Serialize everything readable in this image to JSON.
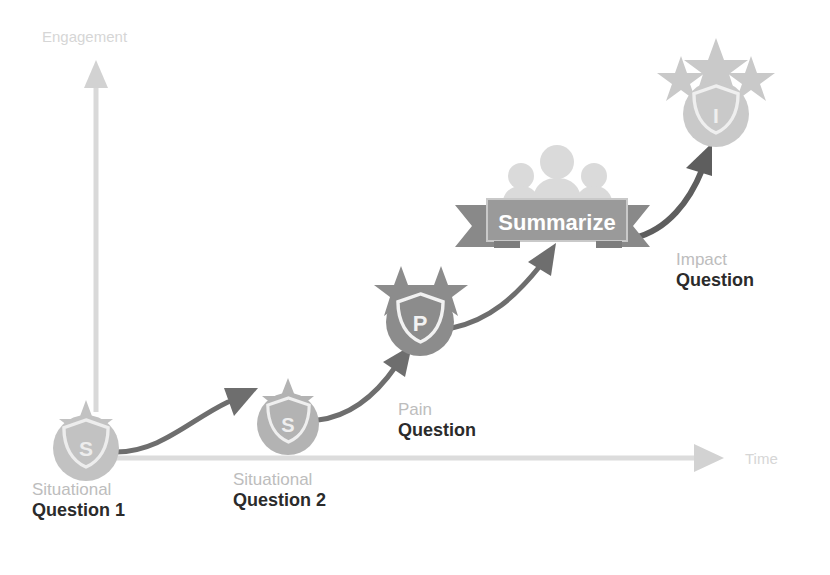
{
  "diagram": {
    "axes": {
      "y": {
        "label": "Engagement",
        "color": "#d6d6d6"
      },
      "x": {
        "label": "Time",
        "color": "#d6d6d6"
      }
    },
    "nodes": [
      {
        "id": "situational-1",
        "badge_letter": "S",
        "stars": 1,
        "category": "Situational",
        "question": "Question 1",
        "circle_color": "#c2c2c2",
        "cx": 86,
        "cy": 448,
        "r": 33
      },
      {
        "id": "situational-2",
        "badge_letter": "S",
        "stars": 1,
        "category": "Situational",
        "question": "Question 2",
        "circle_color": "#b3b3b3",
        "cx": 288,
        "cy": 424,
        "r": 31
      },
      {
        "id": "pain",
        "badge_letter": "P",
        "stars": 2,
        "category": "Pain",
        "question": "Question",
        "circle_color": "#8c8c8c",
        "cx": 420,
        "cy": 322,
        "r": 34
      },
      {
        "id": "impact",
        "badge_letter": "I",
        "stars": 3,
        "category": "Impact",
        "question": "Question",
        "circle_color": "#c9c9c9",
        "cx": 716,
        "cy": 114,
        "r": 33
      }
    ],
    "banner": {
      "label": "Summarize",
      "text_color": "#ffffff",
      "ribbon_color": "#8f8f8f",
      "panel_color": "#9a9a9a",
      "people_color": "#d9d9d9"
    },
    "connectors": [
      {
        "from": "situational-1",
        "to": "situational-2",
        "color": "#6e6e6e"
      },
      {
        "from": "situational-2",
        "to": "pain",
        "color": "#6e6e6e"
      },
      {
        "from": "pain",
        "to": "banner",
        "color": "#6e6e6e"
      },
      {
        "from": "banner",
        "to": "impact",
        "color": "#5e5e5e"
      }
    ],
    "colors": {
      "category_text": "#bdbdbd",
      "question_text": "#2b2b2b",
      "axis": "#d6d6d6",
      "arrow": "#6e6e6e"
    }
  }
}
